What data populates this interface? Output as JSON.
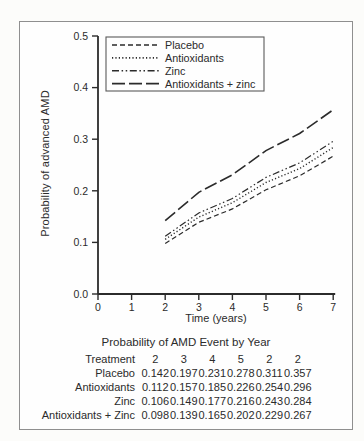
{
  "figure": {
    "background": "#fefefe",
    "frame_border_color": "#8f8f8f",
    "line_color": "#2b2b2b"
  },
  "chart_data": {
    "type": "line",
    "title": "",
    "xlabel": "Time (years)",
    "ylabel": "Probability of advanced AMD",
    "xlim": [
      0,
      7
    ],
    "ylim": [
      0.0,
      0.5
    ],
    "x_ticks": [
      "0",
      "1",
      "2",
      "3",
      "4",
      "5",
      "6",
      "7"
    ],
    "y_ticks": [
      "0.0",
      "0.1",
      "0.2",
      "0.3",
      "0.4",
      "0.5"
    ],
    "grid": false,
    "legend_position": "top-left",
    "x": [
      2,
      3,
      4,
      5,
      6,
      7
    ],
    "series": [
      {
        "name": "Placebo",
        "dash": "short-dash",
        "values": [
          0.098,
          0.139,
          0.165,
          0.202,
          0.229,
          0.267
        ]
      },
      {
        "name": "Antioxidants",
        "dash": "dotted",
        "values": [
          0.106,
          0.149,
          0.177,
          0.216,
          0.243,
          0.284
        ]
      },
      {
        "name": "Zinc",
        "dash": "dash-dot",
        "values": [
          0.112,
          0.157,
          0.185,
          0.226,
          0.254,
          0.296
        ]
      },
      {
        "name": "Antioxidants + zinc",
        "dash": "long-dash",
        "values": [
          0.142,
          0.197,
          0.231,
          0.278,
          0.311,
          0.357
        ]
      }
    ]
  },
  "table": {
    "title": "Probability of AMD Event by Year",
    "columns": [
      "Treatment",
      "2",
      "3",
      "4",
      "5",
      "2",
      "2"
    ],
    "rows": [
      {
        "label": "Placebo",
        "values": [
          "0.142",
          "0.197",
          "0.231",
          "0.278",
          "0.311",
          "0.357"
        ]
      },
      {
        "label": "Antioxidants",
        "values": [
          "0.112",
          "0.157",
          "0.185",
          "0.226",
          "0.254",
          "0.296"
        ]
      },
      {
        "label": "Zinc",
        "values": [
          "0.106",
          "0.149",
          "0.177",
          "0.216",
          "0.243",
          "0.284"
        ]
      },
      {
        "label": "Antioxidants + Zinc",
        "values": [
          "0.098",
          "0.139",
          "0.165",
          "0.202",
          "0.229",
          "0.267"
        ]
      }
    ]
  }
}
